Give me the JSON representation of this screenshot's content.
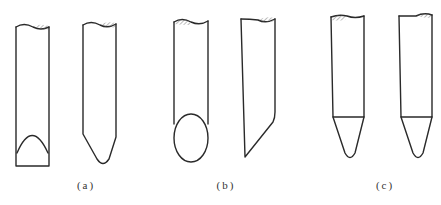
{
  "figure": {
    "line_color": "#2a2a2a",
    "background": "#ffffff",
    "groups": [
      {
        "label": "(a)",
        "variants": [
          "flat end with parabolic face",
          "tapered rounded point"
        ]
      },
      {
        "label": "(b)",
        "variants": [
          "oblique elliptical face",
          "angled bevel cut"
        ]
      },
      {
        "label": "(c)",
        "variants": [
          "conical tip with shoulder line",
          "conical tip with shoulder line"
        ]
      }
    ]
  }
}
